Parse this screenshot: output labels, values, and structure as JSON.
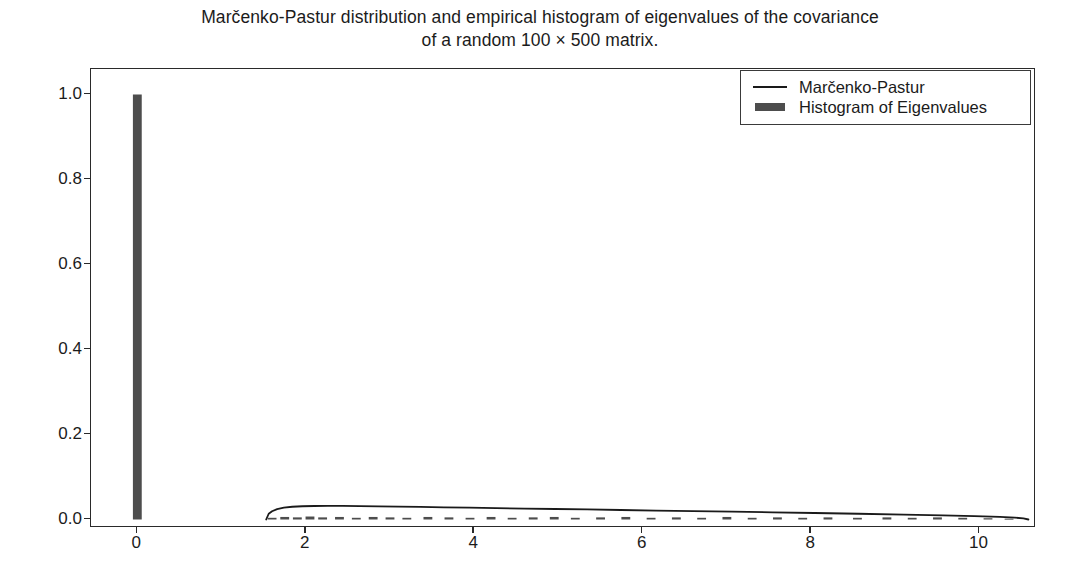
{
  "chart_data": {
    "type": "line",
    "title": "Marčenko-Pastur distribution and empirical histogram of eigenvalues of the covariance\nof a random 100 × 500 matrix.",
    "title_line1": "Marčenko-Pastur distribution and empirical histogram of eigenvalues of the covariance",
    "title_line2": "of a random 100 × 500 matrix.",
    "xlabel": "",
    "ylabel": "",
    "xlim": [
      -0.55,
      10.67
    ],
    "ylim": [
      -0.02,
      1.06
    ],
    "xticks": [
      0,
      2,
      4,
      6,
      8,
      10
    ],
    "xtick_labels": [
      "0",
      "2",
      "4",
      "6",
      "8",
      "10"
    ],
    "yticks": [
      0.0,
      0.2,
      0.4,
      0.6,
      0.8,
      1.0
    ],
    "ytick_labels": [
      "0.0",
      "0.2",
      "0.4",
      "0.6",
      "0.8",
      "1.0"
    ],
    "grid": false,
    "legend_position": "upper right",
    "legend": [
      {
        "label": "Marčenko-Pastur",
        "marker": "line",
        "color": "#1a1a1a"
      },
      {
        "label": "Histogram of Eigenvalues",
        "marker": "bar",
        "color": "#4d4d4d"
      }
    ],
    "series": [
      {
        "name": "Marčenko-Pastur",
        "type": "line",
        "color": "#1a1a1a",
        "x": [
          1.53,
          1.56,
          1.6,
          1.66,
          1.74,
          1.84,
          1.96,
          2.1,
          2.26,
          2.44,
          2.64,
          2.86,
          3.1,
          3.36,
          3.64,
          3.94,
          4.26,
          4.6,
          4.96,
          5.34,
          5.74,
          6.16,
          6.6,
          7.06,
          7.54,
          8.04,
          8.56,
          9.1,
          9.56,
          9.94,
          10.24,
          10.42,
          10.52,
          10.58
        ],
        "y": [
          0.0,
          0.0135,
          0.0195,
          0.0245,
          0.028,
          0.03,
          0.0312,
          0.0318,
          0.032,
          0.0319,
          0.0315,
          0.031,
          0.0303,
          0.0295,
          0.0287,
          0.0278,
          0.0268,
          0.0258,
          0.0247,
          0.0236,
          0.0224,
          0.0211,
          0.0198,
          0.0184,
          0.0169,
          0.0153,
          0.0135,
          0.0115,
          0.0098,
          0.008,
          0.006,
          0.0043,
          0.0026,
          0.0
        ]
      },
      {
        "name": "Histogram of Eigenvalues",
        "type": "bar",
        "color": "#4d4d4d",
        "bar_width": 0.105,
        "x": [
          0.0,
          1.6,
          1.75,
          1.9,
          2.05,
          2.2,
          2.4,
          2.6,
          2.8,
          3.0,
          3.2,
          3.45,
          3.7,
          3.95,
          4.2,
          4.45,
          4.7,
          4.95,
          5.2,
          5.5,
          5.8,
          6.1,
          6.4,
          6.7,
          7.0,
          7.3,
          7.6,
          7.9,
          8.2,
          8.55,
          8.9,
          9.2,
          9.5,
          9.8,
          10.1,
          10.35
        ],
        "y": [
          1.0,
          0.004,
          0.006,
          0.005,
          0.007,
          0.005,
          0.006,
          0.004,
          0.006,
          0.005,
          0.004,
          0.006,
          0.005,
          0.004,
          0.006,
          0.004,
          0.005,
          0.006,
          0.004,
          0.005,
          0.006,
          0.004,
          0.005,
          0.004,
          0.006,
          0.004,
          0.005,
          0.004,
          0.005,
          0.004,
          0.005,
          0.004,
          0.005,
          0.004,
          0.003,
          0.002
        ]
      }
    ],
    "notes": {
      "mp_support_lower": 1.53,
      "mp_support_upper": 10.58,
      "mp_peak_value": 0.032,
      "zero_eigenvalue_mass": 1.0
    }
  }
}
